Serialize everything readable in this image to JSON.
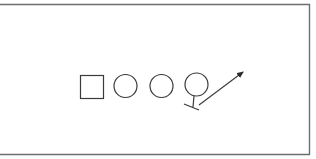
{
  "diagram": {
    "type": "play-diagram",
    "colors": {
      "background": "#ffffff",
      "frame": "#6e6e6e",
      "stroke": "#3a3a3a"
    },
    "frame": {
      "top_y": 4.5,
      "bottom_y": 154.5,
      "right_x": 309.5,
      "left_x": -2
    },
    "players": [
      {
        "id": "square",
        "shape": "square",
        "x": 80.5,
        "y": 75.5,
        "size": 23
      },
      {
        "id": "circle-1",
        "shape": "circle",
        "cx": 125.5,
        "cy": 86,
        "r": 11.5
      },
      {
        "id": "circle-2",
        "shape": "circle",
        "cx": 161.5,
        "cy": 86,
        "r": 11.5
      },
      {
        "id": "circle-3",
        "shape": "circle",
        "cx": 196.5,
        "cy": 84.5,
        "r": 11.5
      }
    ],
    "block": {
      "stem": {
        "x1": 194,
        "y1": 96,
        "x2": 193,
        "y2": 107
      },
      "bar": {
        "x1": 184,
        "y1": 104,
        "x2": 199,
        "y2": 110
      }
    },
    "route_arrow": {
      "x1": 199,
      "y1": 105,
      "x2": 243,
      "y2": 72
    }
  }
}
